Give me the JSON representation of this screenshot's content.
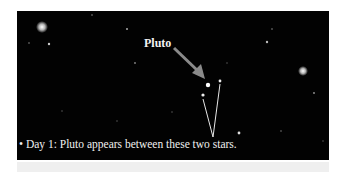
{
  "figure": {
    "label": "Pluto",
    "caption": "Day 1: Pluto appears between these two stars.",
    "caption_bullet": "•",
    "colors": {
      "background": "#020202",
      "text": "#f0f0f0",
      "arrow": "#8a8a8a",
      "lines": "#e8e8e8"
    }
  }
}
